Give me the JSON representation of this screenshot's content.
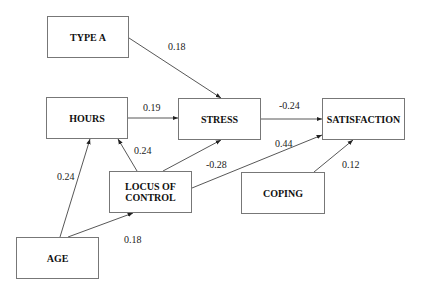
{
  "diagram": {
    "type": "path-diagram",
    "nodes": [
      {
        "id": "type_a",
        "label": "TYPE A",
        "x": 47,
        "y": 16,
        "w": 82,
        "h": 42
      },
      {
        "id": "hours",
        "label": "HOURS",
        "x": 46,
        "y": 97,
        "w": 82,
        "h": 42
      },
      {
        "id": "stress",
        "label": "STRESS",
        "x": 178,
        "y": 98,
        "w": 83,
        "h": 42
      },
      {
        "id": "satisfaction",
        "label": "SATISFACTION",
        "x": 322,
        "y": 98,
        "w": 83,
        "h": 42
      },
      {
        "id": "locus",
        "label": "LOCUS OF CONTROL",
        "x": 109,
        "y": 171,
        "w": 83,
        "h": 42
      },
      {
        "id": "coping",
        "label": "COPING",
        "x": 241,
        "y": 172,
        "w": 84,
        "h": 42
      },
      {
        "id": "age",
        "label": "AGE",
        "x": 16,
        "y": 237,
        "w": 83,
        "h": 42
      }
    ],
    "edges": [
      {
        "from": "type_a",
        "to": "stress",
        "coef": "0.18",
        "x1": 129,
        "y1": 38,
        "x2": 221,
        "y2": 98,
        "lx": 168,
        "ly": 42
      },
      {
        "from": "hours",
        "to": "stress",
        "coef": "0.19",
        "x1": 128,
        "y1": 118,
        "x2": 178,
        "y2": 118,
        "lx": 143,
        "ly": 103
      },
      {
        "from": "stress",
        "to": "satisfaction",
        "coef": "-0.24",
        "x1": 261,
        "y1": 119,
        "x2": 322,
        "y2": 119,
        "lx": 279,
        "ly": 101
      },
      {
        "from": "locus",
        "to": "hours",
        "coef": "0.24",
        "x1": 137,
        "y1": 171,
        "x2": 118,
        "y2": 139,
        "lx": 134,
        "ly": 146
      },
      {
        "from": "locus",
        "to": "stress",
        "coef": "-0.28",
        "x1": 163,
        "y1": 171,
        "x2": 221,
        "y2": 140,
        "lx": 206,
        "ly": 160
      },
      {
        "from": "locus",
        "to": "satisfaction",
        "coef": "0.44",
        "x1": 192,
        "y1": 188,
        "x2": 322,
        "y2": 135,
        "lx": 275,
        "ly": 139
      },
      {
        "from": "coping",
        "to": "satisfaction",
        "coef": "0.12",
        "x1": 314,
        "y1": 172,
        "x2": 353,
        "y2": 140,
        "lx": 342,
        "ly": 160
      },
      {
        "from": "age",
        "to": "hours",
        "coef": "0.24",
        "x1": 60,
        "y1": 237,
        "x2": 90,
        "y2": 139,
        "lx": 57,
        "ly": 172
      },
      {
        "from": "age",
        "to": "locus",
        "coef": "0.18",
        "x1": 68,
        "y1": 237,
        "x2": 133,
        "y2": 213,
        "lx": 124,
        "ly": 235
      }
    ]
  }
}
